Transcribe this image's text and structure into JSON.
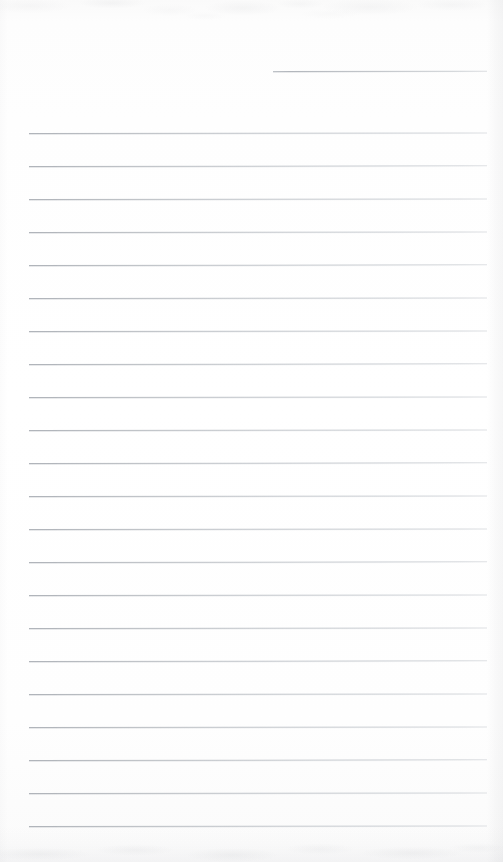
{
  "document": {
    "kind": "scanned-lined-notebook-page",
    "page_width": 503,
    "page_height": 862,
    "paper_color": "#fdfdfd",
    "rule_color": "#b8bcc1",
    "edge_shadow_color": "#969aa0",
    "written_content": "",
    "content_note": "blank page - no handwriting or printed text present"
  },
  "ruling": {
    "rule_thickness_px": 1,
    "line_spacing_px": 33,
    "left_margin_px": 29,
    "right_margin_px": 487,
    "full_rule_count": 22,
    "first_full_rule_y": 133,
    "last_full_rule_y": 826,
    "date_rule": {
      "label": "date-rule",
      "y": 71,
      "x_start": 273,
      "x_end": 487
    },
    "full_rules": [
      {
        "index": 1,
        "y": 133,
        "x_start": 29,
        "x_end": 487
      },
      {
        "index": 2,
        "y": 166,
        "x_start": 29,
        "x_end": 487
      },
      {
        "index": 3,
        "y": 199,
        "x_start": 29,
        "x_end": 487
      },
      {
        "index": 4,
        "y": 232,
        "x_start": 29,
        "x_end": 487
      },
      {
        "index": 5,
        "y": 265,
        "x_start": 29,
        "x_end": 487
      },
      {
        "index": 6,
        "y": 298,
        "x_start": 29,
        "x_end": 487
      },
      {
        "index": 7,
        "y": 331,
        "x_start": 29,
        "x_end": 487
      },
      {
        "index": 8,
        "y": 364,
        "x_start": 29,
        "x_end": 487
      },
      {
        "index": 9,
        "y": 397,
        "x_start": 29,
        "x_end": 487
      },
      {
        "index": 10,
        "y": 430,
        "x_start": 29,
        "x_end": 487
      },
      {
        "index": 11,
        "y": 463,
        "x_start": 29,
        "x_end": 487
      },
      {
        "index": 12,
        "y": 496,
        "x_start": 29,
        "x_end": 487
      },
      {
        "index": 13,
        "y": 529,
        "x_start": 29,
        "x_end": 487
      },
      {
        "index": 14,
        "y": 562,
        "x_start": 29,
        "x_end": 487
      },
      {
        "index": 15,
        "y": 595,
        "x_start": 29,
        "x_end": 487
      },
      {
        "index": 16,
        "y": 628,
        "x_start": 29,
        "x_end": 487
      },
      {
        "index": 17,
        "y": 661,
        "x_start": 29,
        "x_end": 487
      },
      {
        "index": 18,
        "y": 694,
        "x_start": 29,
        "x_end": 487
      },
      {
        "index": 19,
        "y": 727,
        "x_start": 29,
        "x_end": 487
      },
      {
        "index": 20,
        "y": 760,
        "x_start": 29,
        "x_end": 487
      },
      {
        "index": 21,
        "y": 793,
        "x_start": 29,
        "x_end": 487
      },
      {
        "index": 22,
        "y": 826,
        "x_start": 29,
        "x_end": 487
      }
    ]
  }
}
